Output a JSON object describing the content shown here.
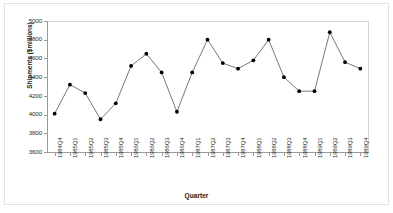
{
  "chart_data": {
    "type": "line",
    "title": "",
    "xlabel": "Quarter",
    "ylabel": "Shipments ($millions)",
    "ylim": [
      3600,
      5000
    ],
    "ytick_step": 200,
    "yticks": [
      5000,
      4800,
      4600,
      4400,
      4200,
      4000,
      3800,
      3600
    ],
    "grid": false,
    "legend": null,
    "marker": "filled-circle",
    "line_color": "#555555",
    "marker_color": "#000000",
    "categories": [
      "1984Q4",
      "1985Q1",
      "1985Q2",
      "1985Q3",
      "1985Q4",
      "1986Q1",
      "1986Q2",
      "1986Q3",
      "1986Q4",
      "1987Q1",
      "1987Q2",
      "1987Q3",
      "1987Q4",
      "1988Q1",
      "1988Q2",
      "1988Q3",
      "1988Q4",
      "1989Q1",
      "1989Q2",
      "1989Q3",
      "1989Q4"
    ],
    "values": [
      4010,
      4320,
      4230,
      3950,
      4120,
      4520,
      4650,
      4450,
      4030,
      4450,
      4800,
      4550,
      4490,
      4580,
      4800,
      4400,
      4250,
      4250,
      4880,
      4560,
      4490
    ]
  }
}
